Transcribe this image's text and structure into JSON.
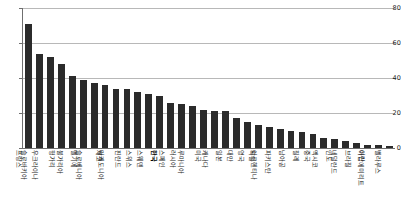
{
  "chart_data": {
    "type": "bar",
    "title": "",
    "subtitle": "",
    "xlabel": "",
    "ylabel": "",
    "ylim": [
      0,
      80
    ],
    "grid": true,
    "legend": "none",
    "orientation": "vertical",
    "bar_color": "#2b2b2b",
    "highlight_category": "한국",
    "yticks": [
      0,
      20,
      40,
      60,
      80
    ],
    "ytick_labels": [
      "0",
      "20",
      "40",
      "60",
      "80"
    ],
    "categories": [
      "프랑스",
      "슬로바키아",
      "우크라이나",
      "헝가리",
      "불가리아",
      "벨기에",
      "슬로베니아",
      "체코",
      "마케도니아",
      "핀란드",
      "스위스",
      "스웨덴",
      "한국",
      "스페인",
      "러시아",
      "루마니아",
      "미국",
      "캐나다",
      "일본",
      "대만",
      "영국",
      "독일",
      "아르헨티나",
      "파키스탄",
      "남아공",
      "칠레",
      "중국",
      "멕시코",
      "인도",
      "네덜란드",
      "브라질",
      "이란",
      "아랍에미리트",
      "벨라루스"
    ],
    "values": [
      71,
      54,
      52,
      48,
      41,
      39,
      37,
      36,
      34,
      34,
      32,
      31,
      30,
      26,
      25,
      24,
      22,
      21,
      21,
      17,
      15,
      13,
      12,
      11,
      10,
      9,
      8,
      6,
      5,
      4,
      3,
      2,
      2,
      1
    ]
  }
}
